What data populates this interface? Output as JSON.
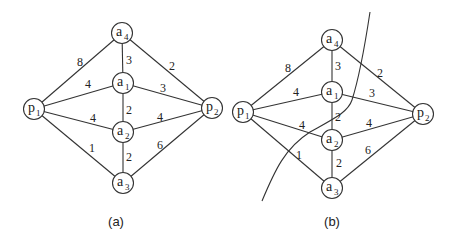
{
  "diagrams": [
    {
      "id": "a",
      "caption": "(a)",
      "caption_pos": [
        116,
        226
      ],
      "nodes": [
        {
          "id": "p1",
          "base": "p",
          "sub": "1",
          "x": 34,
          "y": 109
        },
        {
          "id": "a4",
          "base": "a",
          "sub": "4",
          "x": 122,
          "y": 33
        },
        {
          "id": "a1",
          "base": "a",
          "sub": "1",
          "x": 123,
          "y": 83
        },
        {
          "id": "a2",
          "base": "a",
          "sub": "2",
          "x": 123,
          "y": 132
        },
        {
          "id": "a3",
          "base": "a",
          "sub": "3",
          "x": 123,
          "y": 183
        },
        {
          "id": "p2",
          "base": "p",
          "sub": "2",
          "x": 212,
          "y": 108
        }
      ],
      "edges": [
        {
          "from": "p1",
          "to": "a4",
          "weight": "8",
          "lx": 80,
          "ly": 66
        },
        {
          "from": "p1",
          "to": "a1",
          "weight": "4",
          "lx": 88,
          "ly": 88
        },
        {
          "from": "p1",
          "to": "a2",
          "weight": "4",
          "lx": 93,
          "ly": 122
        },
        {
          "from": "p1",
          "to": "a3",
          "weight": "1",
          "lx": 92,
          "ly": 152
        },
        {
          "from": "a4",
          "to": "a1",
          "weight": "3",
          "lx": 129,
          "ly": 64
        },
        {
          "from": "a1",
          "to": "a2",
          "weight": "2",
          "lx": 129,
          "ly": 114
        },
        {
          "from": "a2",
          "to": "a3",
          "weight": "2",
          "lx": 129,
          "ly": 161
        },
        {
          "from": "a4",
          "to": "p2",
          "weight": "2",
          "lx": 172,
          "ly": 70
        },
        {
          "from": "a1",
          "to": "p2",
          "weight": "3",
          "lx": 163,
          "ly": 92
        },
        {
          "from": "a2",
          "to": "p2",
          "weight": "4",
          "lx": 160,
          "ly": 121
        },
        {
          "from": "a3",
          "to": "p2",
          "weight": "6",
          "lx": 160,
          "ly": 149
        }
      ]
    },
    {
      "id": "b",
      "caption": "(b)",
      "caption_pos": [
        332,
        226
      ],
      "nodes": [
        {
          "id": "p1",
          "base": "p",
          "sub": "1",
          "x": 243,
          "y": 112
        },
        {
          "id": "a4",
          "base": "a",
          "sub": "4",
          "x": 332,
          "y": 40
        },
        {
          "id": "a1",
          "base": "a",
          "sub": "1",
          "x": 332,
          "y": 92
        },
        {
          "id": "a2",
          "base": "a",
          "sub": "2",
          "x": 332,
          "y": 140
        },
        {
          "id": "a3",
          "base": "a",
          "sub": "3",
          "x": 332,
          "y": 188
        },
        {
          "id": "p2",
          "base": "p",
          "sub": "2",
          "x": 423,
          "y": 114
        }
      ],
      "edges": [
        {
          "from": "p1",
          "to": "a4",
          "weight": "8",
          "lx": 288,
          "ly": 72
        },
        {
          "from": "p1",
          "to": "a1",
          "weight": "4",
          "lx": 296,
          "ly": 96
        },
        {
          "from": "p1",
          "to": "a2",
          "weight": "4",
          "lx": 302,
          "ly": 129
        },
        {
          "from": "p1",
          "to": "a3",
          "weight": "1",
          "lx": 299,
          "ly": 159
        },
        {
          "from": "a4",
          "to": "a1",
          "weight": "3",
          "lx": 338,
          "ly": 70
        },
        {
          "from": "a1",
          "to": "a2",
          "weight": "2",
          "lx": 338,
          "ly": 121
        },
        {
          "from": "a2",
          "to": "a3",
          "weight": "2",
          "lx": 339,
          "ly": 167
        },
        {
          "from": "a4",
          "to": "p2",
          "weight": "2",
          "lx": 380,
          "ly": 77
        },
        {
          "from": "a1",
          "to": "p2",
          "weight": "3",
          "lx": 372,
          "ly": 97
        },
        {
          "from": "a2",
          "to": "p2",
          "weight": "4",
          "lx": 369,
          "ly": 127
        },
        {
          "from": "a3",
          "to": "p2",
          "weight": "6",
          "lx": 368,
          "ly": 154
        }
      ],
      "cut_curve": "M 262 201 C 275 170, 285 148, 310 132 C 335 118, 348 112, 352 100 C 360 75, 365 45, 370 12"
    }
  ],
  "node_radius": 10.5
}
